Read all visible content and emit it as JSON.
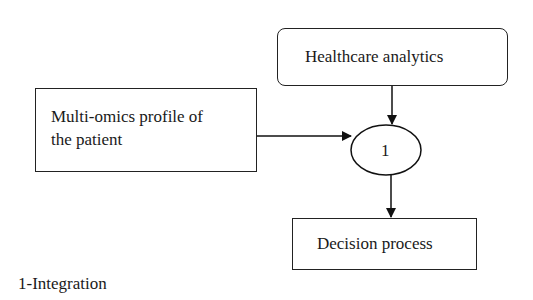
{
  "diagram": {
    "nodes": [
      {
        "id": "healthcare",
        "label": "Healthcare analytics",
        "shape": "rounded-rect"
      },
      {
        "id": "multiomics",
        "label_lines": [
          "Multi-omics profile of",
          "the patient"
        ],
        "shape": "rect"
      },
      {
        "id": "integration",
        "label": "1",
        "shape": "ellipse"
      },
      {
        "id": "decision",
        "label": "Decision process",
        "shape": "rect"
      }
    ],
    "edges": [
      {
        "from": "healthcare",
        "to": "integration"
      },
      {
        "from": "multiomics",
        "to": "integration"
      },
      {
        "from": "integration",
        "to": "decision"
      }
    ],
    "legend": "1-Integration"
  }
}
